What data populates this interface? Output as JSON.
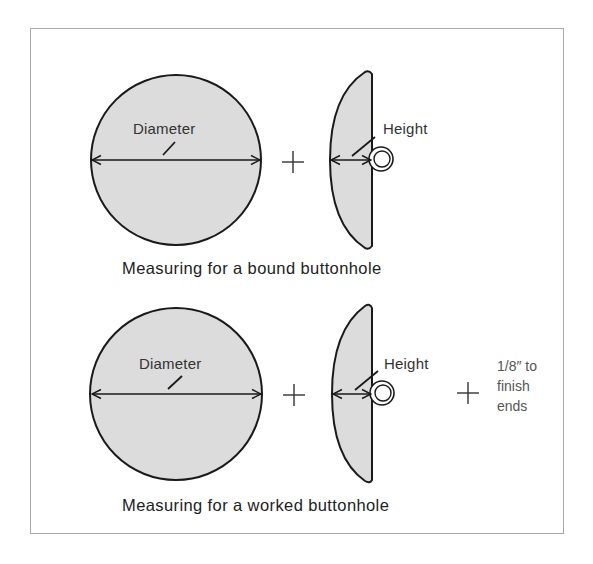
{
  "diagram": {
    "fill_color": "#dcdcdc",
    "stroke_color": "#1a1a1a",
    "frame_color": "#a9a9a9",
    "panels": [
      {
        "id": "bound",
        "diameter_label": "Diameter",
        "height_label": "Height",
        "operator": "+",
        "caption": "Measuring for a bound buttonhole"
      },
      {
        "id": "worked",
        "diameter_label": "Diameter",
        "height_label": "Height",
        "operator": "+",
        "extra_operator": "+",
        "extra_note": [
          "1/8″ to",
          "finish",
          "ends"
        ],
        "caption": "Measuring for a worked buttonhole"
      }
    ]
  }
}
